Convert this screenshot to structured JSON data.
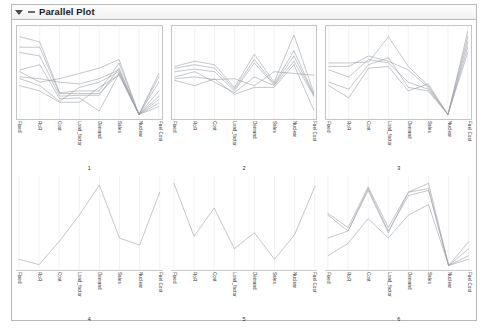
{
  "panel": {
    "title": "Parallel Plot",
    "disclosure_icon": "triangle-down-icon",
    "handle_icon": "dash-icon",
    "border_color": "#b9b9b9"
  },
  "chart_data": {
    "type": "line",
    "title": "Parallel Plot",
    "xlabel": "",
    "ylabel": "",
    "grid": true,
    "legend": "none",
    "axes": [
      "Fixed",
      "RoR",
      "Cost",
      "Load_factor",
      "Demand",
      "Sales",
      "Nuclear",
      "Fuel Cost"
    ],
    "ylim": [
      0,
      1
    ],
    "line_color": "#9aa0a6",
    "panels": [
      {
        "number": "1",
        "series": [
          {
            "name": "s1",
            "values": [
              0.92,
              0.86,
              0.28,
              0.3,
              0.3,
              0.62,
              0.03,
              0.46
            ]
          },
          {
            "name": "s2",
            "values": [
              0.8,
              0.8,
              0.27,
              0.27,
              0.27,
              0.5,
              0.03,
              0.3
            ]
          },
          {
            "name": "s3",
            "values": [
              0.74,
              0.7,
              0.24,
              0.25,
              0.25,
              0.56,
              0.03,
              0.24
            ]
          },
          {
            "name": "s4",
            "values": [
              0.54,
              0.6,
              0.21,
              0.22,
              0.07,
              0.5,
              0.03,
              0.2
            ]
          },
          {
            "name": "s5",
            "values": [
              0.52,
              0.4,
              0.44,
              0.5,
              0.56,
              0.66,
              0.03,
              0.16
            ]
          },
          {
            "name": "s6",
            "values": [
              0.46,
              0.44,
              0.4,
              0.38,
              0.44,
              0.54,
              0.03,
              0.5
            ]
          },
          {
            "name": "s7",
            "values": [
              0.44,
              0.36,
              0.18,
              0.34,
              0.4,
              0.52,
              0.03,
              0.12
            ]
          },
          {
            "name": "s8",
            "values": [
              0.36,
              0.3,
              0.17,
              0.17,
              0.34,
              0.48,
              0.03,
              0.4
            ]
          }
        ]
      },
      {
        "number": "2",
        "series": [
          {
            "name": "s1",
            "values": [
              0.58,
              0.64,
              0.6,
              0.34,
              0.72,
              0.4,
              0.94,
              0.28
            ]
          },
          {
            "name": "s2",
            "values": [
              0.56,
              0.6,
              0.56,
              0.32,
              0.66,
              0.38,
              0.76,
              0.26
            ]
          },
          {
            "name": "s3",
            "values": [
              0.52,
              0.55,
              0.52,
              0.3,
              0.62,
              0.37,
              0.7,
              0.25
            ]
          },
          {
            "name": "s4",
            "values": [
              0.46,
              0.52,
              0.4,
              0.28,
              0.46,
              0.36,
              0.64,
              0.24
            ]
          },
          {
            "name": "s5",
            "values": [
              0.44,
              0.46,
              0.43,
              0.44,
              0.36,
              0.52,
              0.5,
              0.48
            ]
          },
          {
            "name": "s6",
            "values": [
              0.42,
              0.36,
              0.44,
              0.26,
              0.34,
              0.34,
              0.6,
              0.08
            ]
          }
        ]
      },
      {
        "number": "3",
        "series": [
          {
            "name": "s1",
            "values": [
              0.62,
              0.62,
              0.63,
              0.92,
              0.58,
              0.36,
              0.03,
              0.98
            ]
          },
          {
            "name": "s2",
            "values": [
              0.58,
              0.58,
              0.7,
              0.64,
              0.54,
              0.34,
              0.03,
              0.92
            ]
          },
          {
            "name": "s3",
            "values": [
              0.54,
              0.46,
              0.66,
              0.62,
              0.4,
              0.32,
              0.03,
              0.86
            ]
          },
          {
            "name": "s4",
            "values": [
              0.4,
              0.32,
              0.6,
              0.68,
              0.34,
              0.3,
              0.03,
              0.8
            ]
          },
          {
            "name": "s5",
            "values": [
              0.36,
              0.22,
              0.56,
              0.58,
              0.3,
              0.38,
              0.03,
              0.74
            ]
          }
        ]
      },
      {
        "number": "4",
        "series": [
          {
            "name": "s1",
            "values": [
              0.1,
              0.04,
              0.3,
              0.6,
              0.94,
              0.34,
              0.26,
              0.86
            ]
          }
        ]
      },
      {
        "number": "5",
        "series": [
          {
            "name": "s1",
            "values": [
              0.96,
              0.36,
              0.68,
              0.22,
              0.4,
              0.1,
              0.38,
              0.92
            ]
          }
        ]
      },
      {
        "number": "6",
        "series": [
          {
            "name": "s1",
            "values": [
              0.62,
              0.46,
              0.92,
              0.46,
              0.86,
              0.96,
              0.03,
              0.3
            ]
          },
          {
            "name": "s2",
            "values": [
              0.6,
              0.42,
              0.9,
              0.42,
              0.82,
              0.88,
              0.03,
              0.22
            ]
          },
          {
            "name": "s3",
            "values": [
              0.34,
              0.42,
              0.88,
              0.4,
              0.86,
              0.9,
              0.03,
              0.14
            ]
          },
          {
            "name": "s4",
            "values": [
              0.14,
              0.28,
              0.56,
              0.34,
              0.6,
              0.72,
              0.03,
              0.1
            ]
          }
        ]
      }
    ]
  }
}
